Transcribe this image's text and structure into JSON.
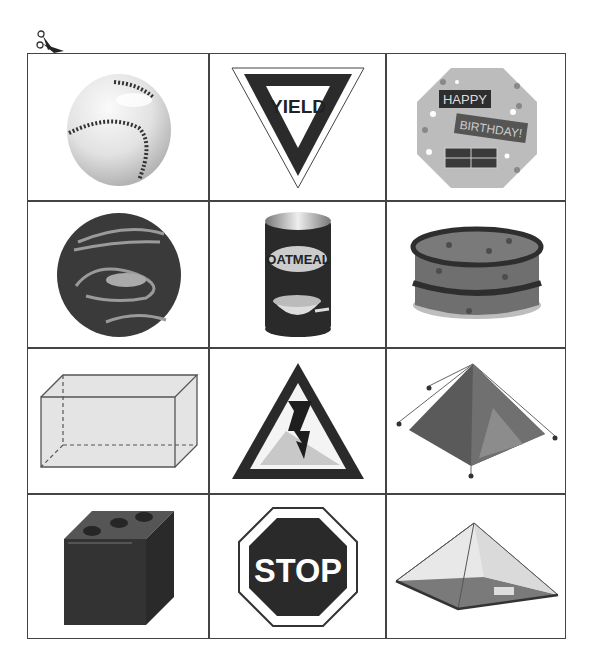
{
  "page": {
    "cut_marker": "scissors-icon"
  },
  "grid": {
    "rows": 4,
    "columns": 3,
    "cells": [
      {
        "row": 1,
        "col": 1,
        "item": "baseball",
        "shape": "sphere"
      },
      {
        "row": 1,
        "col": 2,
        "item": "yield sign",
        "shape": "triangle",
        "label": "YIELD"
      },
      {
        "row": 1,
        "col": 3,
        "item": "birthday card",
        "shape": "octagon",
        "label_line1": "HAPPY",
        "label_line2": "BIRTHDAY!"
      },
      {
        "row": 2,
        "col": 1,
        "item": "marbled planet ball",
        "shape": "sphere"
      },
      {
        "row": 2,
        "col": 2,
        "item": "oatmeal can",
        "shape": "cylinder",
        "label": "OATMEAL"
      },
      {
        "row": 2,
        "col": 3,
        "item": "layer cake",
        "shape": "cylinder"
      },
      {
        "row": 3,
        "col": 1,
        "item": "rectangular prism",
        "shape": "rectangular prism"
      },
      {
        "row": 3,
        "col": 2,
        "item": "high voltage warning sign",
        "shape": "triangle"
      },
      {
        "row": 3,
        "col": 3,
        "item": "pyramid tent",
        "shape": "pyramid"
      },
      {
        "row": 4,
        "col": 1,
        "item": "die",
        "shape": "cube"
      },
      {
        "row": 4,
        "col": 2,
        "item": "stop sign",
        "shape": "octagon",
        "label": "STOP"
      },
      {
        "row": 4,
        "col": 3,
        "item": "glass pyramid",
        "shape": "pyramid"
      }
    ]
  },
  "colors": {
    "border": "#444444",
    "dark": "#333333",
    "mid": "#777777",
    "light": "#c8c8c8"
  }
}
